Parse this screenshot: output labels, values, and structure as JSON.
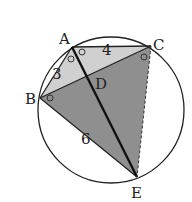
{
  "diagram": {
    "type": "geometry-circle-inscribed-quadrilateral",
    "points": {
      "A": {
        "label": "A",
        "x": 72,
        "y": 47
      },
      "B": {
        "label": "B",
        "x": 40,
        "y": 98
      },
      "C": {
        "label": "C",
        "x": 151,
        "y": 46
      },
      "D": {
        "label": "D",
        "x": 88,
        "y": 78
      },
      "E": {
        "label": "E",
        "x": 137,
        "y": 177
      }
    },
    "circle": {
      "cx": 111,
      "cy": 110,
      "r": 73
    },
    "segments": {
      "AC": {
        "label": "4"
      },
      "AB": {
        "label": "3"
      },
      "BE": {
        "label": "6"
      }
    },
    "regions": {
      "triangle_ABC": {
        "fill": "#d0d0d0"
      },
      "triangle_BCE": {
        "fill": "#8f8f8f"
      }
    },
    "colors": {
      "stroke": "#222222",
      "light_fill": "#d0d0d0",
      "dark_fill": "#8f8f8f"
    },
    "angle_markers": [
      "BAE",
      "EAC",
      "ACB",
      "ABC"
    ]
  }
}
